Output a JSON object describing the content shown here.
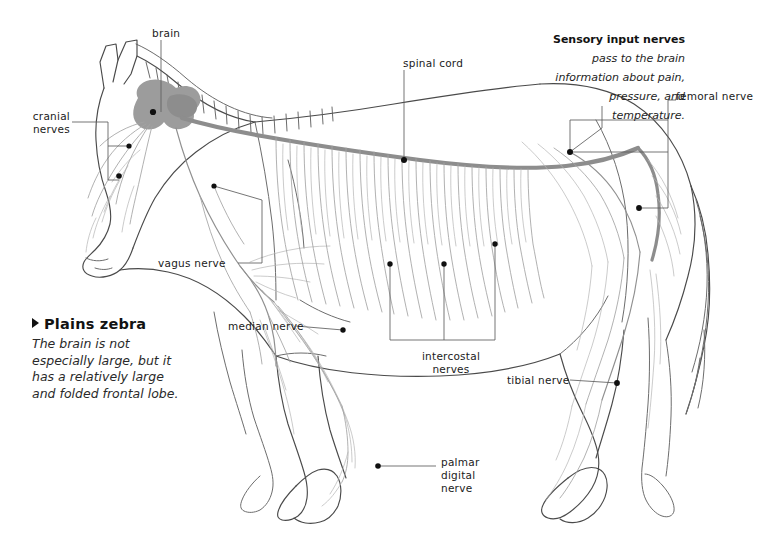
{
  "figure": {
    "subject": "Plains zebra",
    "topic": "nervous system",
    "background_color": "#ffffff",
    "outline_color": "#4a4a4a",
    "nerve_color": "#9a9a9a",
    "spinal_cord_color": "#8f8f8f",
    "brain_color": "#9c9c9c",
    "leader_color": "#5a5a5a",
    "dot_color": "#111111"
  },
  "caption": {
    "marker": "triangle-right",
    "title": "Plains zebra",
    "body": "The brain is not\nespecially large, but it\nhas a relatively large\nand folded frontal lobe."
  },
  "sensory_note": {
    "bold_text": "Sensory input\nnerves ",
    "italic_text": "pass to the\nbrain information\nabout pain, pressure,\nand temperature."
  },
  "labels": [
    {
      "id": "brain",
      "text": "brain",
      "align": "left",
      "x": 152,
      "y": 27,
      "width": 70
    },
    {
      "id": "cranial-nerves",
      "text": "cranial\nnerves",
      "align": "right",
      "x": 8,
      "y": 110,
      "width": 62
    },
    {
      "id": "spinal-cord",
      "text": "spinal cord",
      "align": "left",
      "x": 403,
      "y": 57,
      "width": 80
    },
    {
      "id": "femoral-nerve",
      "text": "femoral nerve",
      "align": "left",
      "x": 676,
      "y": 90,
      "width": 92
    },
    {
      "id": "vagus-nerve",
      "text": "vagus nerve",
      "align": "left",
      "x": 158,
      "y": 257,
      "width": 80
    },
    {
      "id": "median-nerve",
      "text": "median nerve",
      "align": "left",
      "x": 228,
      "y": 320,
      "width": 88
    },
    {
      "id": "intercostal",
      "text": "intercostal\nnerves",
      "align": "center",
      "x": 405,
      "y": 350,
      "width": 92
    },
    {
      "id": "tibial-nerve",
      "text": "tibial nerve",
      "align": "left",
      "x": 507,
      "y": 374,
      "width": 80
    },
    {
      "id": "palmar-digital",
      "text": "palmar\ndigital\nnerve",
      "align": "left",
      "x": 441,
      "y": 456,
      "width": 58
    }
  ],
  "anchor_points": [
    {
      "id": "brain-dot",
      "x": 153,
      "y": 112
    },
    {
      "id": "cranial-upper-dot",
      "x": 129,
      "y": 146
    },
    {
      "id": "cranial-lower-dot",
      "x": 119,
      "y": 176
    },
    {
      "id": "vagus-dot",
      "x": 214,
      "y": 186
    },
    {
      "id": "spinal-cord-dot",
      "x": 404,
      "y": 160
    },
    {
      "id": "femoral-upper-dot",
      "x": 570,
      "y": 152
    },
    {
      "id": "femoral-lower-dot",
      "x": 639,
      "y": 208
    },
    {
      "id": "median-dot",
      "x": 343,
      "y": 330
    },
    {
      "id": "intercostal-dot-1",
      "x": 390,
      "y": 264
    },
    {
      "id": "intercostal-dot-2",
      "x": 444,
      "y": 264
    },
    {
      "id": "intercostal-dot-3",
      "x": 495,
      "y": 244
    },
    {
      "id": "tibial-dot",
      "x": 617,
      "y": 383
    },
    {
      "id": "palmar-dot",
      "x": 378,
      "y": 466
    }
  ]
}
